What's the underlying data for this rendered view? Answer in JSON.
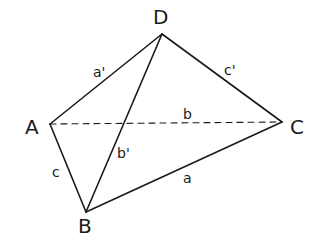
{
  "diagram": {
    "type": "tetrahedron",
    "vertices": {
      "A": {
        "label": "A",
        "x": 50,
        "y": 124
      },
      "B": {
        "label": "B",
        "x": 86,
        "y": 212
      },
      "C": {
        "label": "C",
        "x": 282,
        "y": 122
      },
      "D": {
        "label": "D",
        "x": 162,
        "y": 34
      }
    },
    "edges": [
      {
        "from": "A",
        "to": "D",
        "label": "a'",
        "style": "solid"
      },
      {
        "from": "D",
        "to": "C",
        "label": "c'",
        "style": "solid"
      },
      {
        "from": "A",
        "to": "C",
        "label": "b",
        "style": "dashed"
      },
      {
        "from": "D",
        "to": "B",
        "label": "b'",
        "style": "solid"
      },
      {
        "from": "A",
        "to": "B",
        "label": "c",
        "style": "solid"
      },
      {
        "from": "B",
        "to": "C",
        "label": "a",
        "style": "solid"
      }
    ],
    "vertex_labels": {
      "A": "A",
      "B": "B",
      "C": "C",
      "D": "D"
    },
    "edge_labels": {
      "AD": "a'",
      "DC": "c'",
      "AC": "b",
      "DB": "b'",
      "AB": "c",
      "BC": "a"
    }
  }
}
